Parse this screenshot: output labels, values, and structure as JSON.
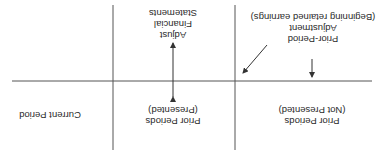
{
  "orientation": "rotated-180",
  "columns": [
    {
      "id": "not_presented",
      "label_line1": "Prior Periods",
      "label_line2": "(Not Presented)"
    },
    {
      "id": "presented",
      "label_line1": "Prior Periods",
      "label_line2": "(Presented)"
    },
    {
      "id": "current",
      "label_line1": "Current Period"
    }
  ],
  "annotations": {
    "adjustment": {
      "line1": "Prior-Period",
      "line2": "Adjustment",
      "line3": "(Beginning retained earnings)"
    },
    "restate": {
      "line1": "Adjust",
      "line2": "Financial",
      "line3": "Statements"
    }
  },
  "colors": {
    "line": "#333333",
    "text": "#2a2a2a",
    "background": "#ffffff"
  }
}
